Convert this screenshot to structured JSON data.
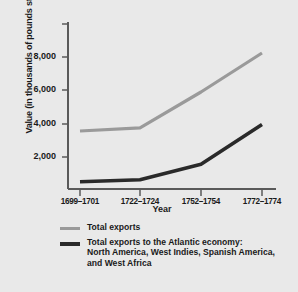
{
  "chart_data": {
    "type": "line",
    "title": "",
    "xlabel": "Year",
    "ylabel": "Value (in thousands of pounds sterling)",
    "categories": [
      "1699–1701",
      "1722–1724",
      "1752–1754",
      "1772–1774"
    ],
    "ylim": [
      0,
      9000
    ],
    "yticks": [
      2000,
      4000,
      6000,
      8000
    ],
    "ytick_labels": [
      "2,000",
      "4,000",
      "6,000",
      "8,000"
    ],
    "grid": false,
    "legend_position": "below",
    "series": [
      {
        "name": "Total exports",
        "color": "#9a9a9a",
        "values": [
          3600,
          3800,
          6000,
          8400
        ]
      },
      {
        "name": "Total exports to the Atlantic economy:\nNorth America, West Indies, Spanish America,\nand West Africa",
        "color": "#2a2a2a",
        "values": [
          475,
          600,
          1550,
          4000
        ]
      }
    ]
  },
  "legend": {
    "items": [
      {
        "label": "Total exports",
        "color": "#9a9a9a"
      },
      {
        "label": "Total exports to the Atlantic economy:\nNorth America, West Indies, Spanish America,\nand West Africa",
        "color": "#2a2a2a"
      }
    ]
  },
  "axes": {
    "y_title": "Value (in thousands of pounds sterling)",
    "x_title": "Year",
    "y_labels": [
      "8,000",
      "6,000",
      "4,000",
      "2,000"
    ],
    "x_labels": [
      "1699–1701",
      "1722–1724",
      "1752–1754",
      "1772–1774"
    ]
  },
  "colors": {
    "background": "#e9e9e9",
    "axis": "#5a5a5a",
    "series_light": "#9a9a9a",
    "series_dark": "#2a2a2a"
  }
}
